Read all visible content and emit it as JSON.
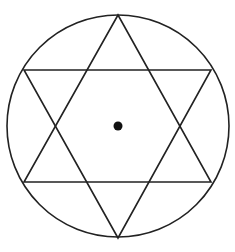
{
  "figure": {
    "title": "Hexagram inscribed in a circle with center point",
    "stroke_color": "#222222",
    "background": "#ffffff",
    "circle": {
      "cx": 118,
      "cy": 126,
      "r": 111
    },
    "center_dot": {
      "cx": 118,
      "cy": 126,
      "r": 4.5
    },
    "triangle_up": {
      "points": "118,15 211,182 24,182"
    },
    "triangle_down": {
      "points": "118,238 24,70 211,70"
    }
  }
}
